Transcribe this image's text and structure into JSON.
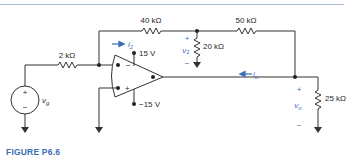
{
  "figure": {
    "caption": "FIGURE P6.6",
    "colors": {
      "accent": "#3a6fb5",
      "wire": "#333333",
      "rule": "#a9bdd6"
    }
  },
  "components": {
    "r_in": {
      "label": "2 kΩ"
    },
    "r_feedback": {
      "label": "40 kΩ"
    },
    "r_shunt": {
      "label": "20 kΩ"
    },
    "r_series": {
      "label": "50 kΩ"
    },
    "r_load": {
      "label": "25 kΩ"
    },
    "source": {
      "label": "v",
      "sub": "g",
      "plus": "+",
      "minus": "−"
    },
    "opamp": {
      "inv": "−",
      "noninv": "+",
      "vpos": "15 V",
      "vneg": "−15 V"
    }
  },
  "annotations": {
    "i2": {
      "label": "i",
      "sub": "2"
    },
    "io": {
      "label": "i",
      "sub": "o"
    },
    "v1": {
      "label": "v",
      "sub": "1",
      "plus": "+",
      "minus": "−"
    },
    "vo": {
      "label": "v",
      "sub": "o",
      "plus": "+",
      "minus": "−"
    }
  }
}
